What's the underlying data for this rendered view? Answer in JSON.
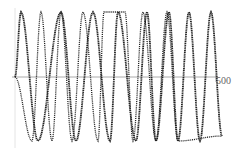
{
  "chart_data": {
    "type": "line",
    "title": "",
    "xlabel": "",
    "ylabel": "",
    "x_tick_labels": [
      "500"
    ],
    "xlim": [
      0,
      500
    ],
    "ylim": [
      -1,
      1
    ],
    "grid": false,
    "legend": null,
    "series": [
      {
        "name": "signal A (dotted, heavier)",
        "style": "dotted",
        "peaks_x": [
          21,
          61,
          93,
          118,
          147,
          169,
          189,
          211
        ],
        "troughs_x": [
          38,
          76,
          110,
          136,
          156,
          178,
          200
        ]
      },
      {
        "name": "signal B (dotted, lighter)",
        "style": "dotted",
        "peaks_x": [
          41,
          61,
          83,
          104,
          125,
          143,
          167
        ],
        "troughs_x": [
          32,
          52,
          72,
          98,
          133,
          156,
          178
        ]
      }
    ]
  },
  "axis": {
    "x_end_label": "500"
  },
  "colors": {
    "curve": "#222222",
    "axis": "#999999"
  }
}
